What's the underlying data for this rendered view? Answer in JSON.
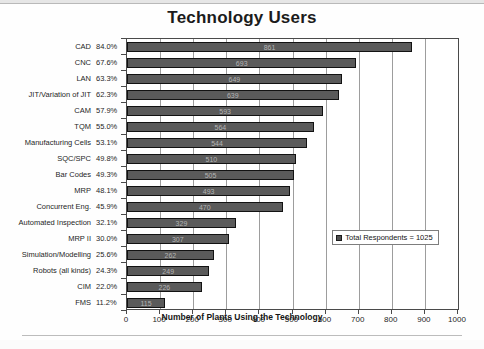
{
  "chart_data": {
    "type": "bar",
    "orientation": "horizontal",
    "title": "Technology Users",
    "xlabel": "Number of Plants Using the Technology",
    "ylabel": "",
    "xlim": [
      0,
      1000
    ],
    "xticks": [
      0,
      100,
      200,
      300,
      400,
      500,
      600,
      700,
      800,
      900,
      1000
    ],
    "grid": true,
    "legend_position": "inside-lower-right",
    "legend_entries": [
      "Total Respondents = 1025"
    ],
    "total_respondents": 1025,
    "bar_color": "#5a5a5a",
    "categories": [
      "CAD",
      "CNC",
      "LAN",
      "JIT/Variation of JIT",
      "CAM",
      "TQM",
      "Manufacturing Cells",
      "SQC/SPC",
      "Bar Codes",
      "MRP",
      "Concurrent Eng.",
      "Automated Inspection",
      "MRP II",
      "Simulation/Modelling",
      "Robots (all kinds)",
      "CIM",
      "FMS"
    ],
    "percents": [
      "84.0%",
      "67.6%",
      "63.3%",
      "62.3%",
      "57.9%",
      "55.0%",
      "53.1%",
      "49.8%",
      "49.3%",
      "48.1%",
      "45.9%",
      "32.1%",
      "30.0%",
      "25.6%",
      "24.3%",
      "22.0%",
      "11.2%"
    ],
    "values": [
      861,
      693,
      649,
      639,
      593,
      564,
      544,
      510,
      505,
      493,
      470,
      329,
      307,
      262,
      249,
      226,
      115
    ],
    "value_labels": [
      "861",
      "693",
      "649",
      "639",
      "593",
      "564",
      "544",
      "510",
      "505",
      "493",
      "470",
      "329",
      "307",
      "262",
      "249",
      "226",
      "115"
    ]
  }
}
